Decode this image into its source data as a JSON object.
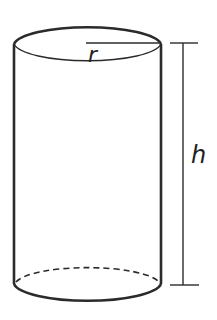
{
  "diagram": {
    "type": "cylinder",
    "labels": {
      "radius": "r",
      "height": "h"
    },
    "colors": {
      "stroke": "#2b2b2b",
      "background": "#ffffff"
    }
  }
}
